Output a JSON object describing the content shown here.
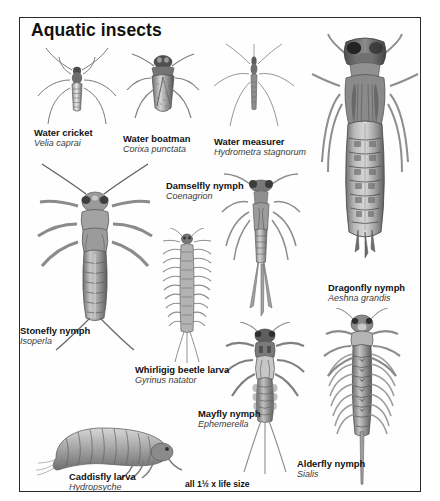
{
  "plate": {
    "title": "Aquatic insects",
    "scale_note": "all 1½ x life size",
    "border_color": "#2b2b2b",
    "background_color": "#ffffff",
    "ink_color": "#555555"
  },
  "specimens": [
    {
      "id": "water-cricket",
      "common_name": "Water cricket",
      "scientific_name": "Velia caprai",
      "label_left": 34,
      "label_top": 127
    },
    {
      "id": "water-boatman",
      "common_name": "Water boatman",
      "scientific_name": "Corixa punctata",
      "label_left": 123,
      "label_top": 133
    },
    {
      "id": "water-measurer",
      "common_name": "Water measurer",
      "scientific_name": "Hydrometra stagnorum",
      "label_left": 214,
      "label_top": 136
    },
    {
      "id": "damselfly-nymph",
      "common_name": "Damselfly nymph",
      "scientific_name": "Coenagrion",
      "label_left": 166,
      "label_top": 180
    },
    {
      "id": "dragonfly-nymph",
      "common_name": "Dragonfly nymph",
      "scientific_name": "Aeshna grandis",
      "label_left": 328,
      "label_top": 282
    },
    {
      "id": "stonefly-nymph",
      "common_name": "Stonefly nymph",
      "scientific_name": "Isoperla",
      "label_left": 20,
      "label_top": 325
    },
    {
      "id": "whirligig-beetle-larva",
      "common_name": "Whirligig beetle larva",
      "scientific_name": "Gyrinus natator",
      "label_left": 135,
      "label_top": 364
    },
    {
      "id": "mayfly-nymph",
      "common_name": "Mayfly nymph",
      "scientific_name": "Ephemerella",
      "label_left": 198,
      "label_top": 408
    },
    {
      "id": "alderfly-nymph",
      "common_name": "Alderfly nymph",
      "scientific_name": "Sialis",
      "label_left": 297,
      "label_top": 458
    },
    {
      "id": "caddisfly-larva",
      "common_name": "Caddisfly larva",
      "scientific_name": "Hydropsyche",
      "label_left": 69,
      "label_top": 471
    }
  ]
}
